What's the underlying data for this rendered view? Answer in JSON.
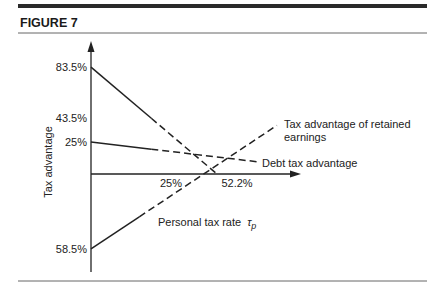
{
  "figure": {
    "title": "FIGURE 7"
  },
  "chart_data": {
    "type": "line",
    "title": "FIGURE 7",
    "xlabel": "Personal tax rate",
    "xlabel_symbol": "τ",
    "xlabel_subscript": "p",
    "ylabel": "Tax advantage",
    "xlim": [
      0,
      86
    ],
    "ylim": [
      -76,
      103
    ],
    "grid": false,
    "x_ticks": [
      {
        "value": 25,
        "label": "25%"
      },
      {
        "value": 52.2,
        "label": "52.2%"
      }
    ],
    "y_ticks": [
      {
        "value": 83.5,
        "label": "83.5%"
      },
      {
        "value": 43.5,
        "label": "43.5%"
      },
      {
        "value": 25,
        "label": "25%"
      },
      {
        "value": -58.5,
        "label": "58.5%"
      }
    ],
    "series": [
      {
        "name": "Total tax advantage",
        "label_lines": [],
        "points": [
          [
            0,
            83.5
          ],
          [
            25,
            43.5
          ],
          [
            52.2,
            0
          ]
        ],
        "solid_until": 25
      },
      {
        "name": "Debt tax advantage",
        "label_lines": [
          "Debt tax advantage"
        ],
        "points": [
          [
            0,
            25
          ],
          [
            25,
            19.4
          ],
          [
            69,
            9.5
          ]
        ],
        "solid_until": 25
      },
      {
        "name": "Tax advantage of retained earnings",
        "label_lines": [
          "Tax advantage of retained",
          "earnings"
        ],
        "points": [
          [
            0,
            -58.5
          ],
          [
            20,
            -33.4
          ],
          [
            77,
            38
          ]
        ],
        "solid_until": 20
      }
    ]
  }
}
